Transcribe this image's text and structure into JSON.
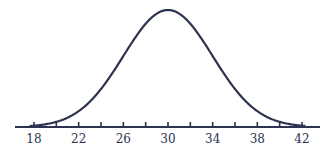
{
  "chart_data": {
    "type": "line",
    "title": "",
    "subtitle": "",
    "xlabel": "",
    "ylabel": "",
    "distribution": {
      "mean": 30,
      "sd": 4
    },
    "x_tick_labels": [
      "18",
      "22",
      "26",
      "30",
      "34",
      "38",
      "42"
    ],
    "x_minor_ticks": [
      18,
      20,
      22,
      24,
      26,
      28,
      30,
      32,
      34,
      36,
      38,
      40,
      42
    ],
    "xlim": [
      16.5,
      43.5
    ],
    "grid": false,
    "legend": null,
    "color": "#2b3350"
  }
}
